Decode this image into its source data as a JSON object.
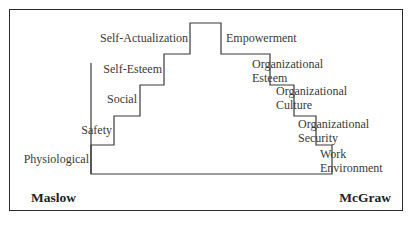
{
  "diagram": {
    "left_title": "Maslow",
    "right_title": "McGraw",
    "maslow_levels": [
      {
        "label": "Physiological"
      },
      {
        "label": "Safety"
      },
      {
        "label": "Social"
      },
      {
        "label": "Self-Esteem"
      },
      {
        "label": "Self-Actualization"
      }
    ],
    "mcgraw_levels": [
      {
        "line1": "Work",
        "line2": "Environment"
      },
      {
        "line1": "Organizational",
        "line2": "Security"
      },
      {
        "line1": "Organizational",
        "line2": "Culture"
      },
      {
        "line1": "Organizational",
        "line2": "Esteem"
      },
      {
        "line1": "Empowerment",
        "line2": ""
      }
    ],
    "line_color": "#3a3a3a",
    "frame_color": "#2a2a2a"
  }
}
